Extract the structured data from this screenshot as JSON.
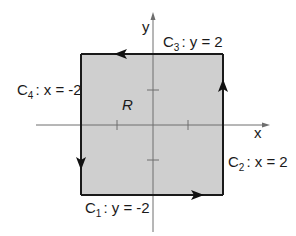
{
  "diagram": {
    "type": "closed-curve-region",
    "region": {
      "label": "R",
      "fill": "#cfcfcf",
      "x_range": [
        -2,
        2
      ],
      "y_range": [
        -2,
        2
      ]
    },
    "axes": {
      "x_label": "x",
      "y_label": "y",
      "ticks": [
        -1,
        1
      ]
    },
    "curves": [
      {
        "name": "C",
        "sub": "1",
        "eq": ": y = -2",
        "direction": "right"
      },
      {
        "name": "C",
        "sub": "2",
        "eq": ": x = 2",
        "direction": "up"
      },
      {
        "name": "C",
        "sub": "3",
        "eq": ": y = 2",
        "direction": "left"
      },
      {
        "name": "C",
        "sub": "4",
        "eq": ": x = -2",
        "direction": "down"
      }
    ],
    "orientation": "counterclockwise"
  }
}
